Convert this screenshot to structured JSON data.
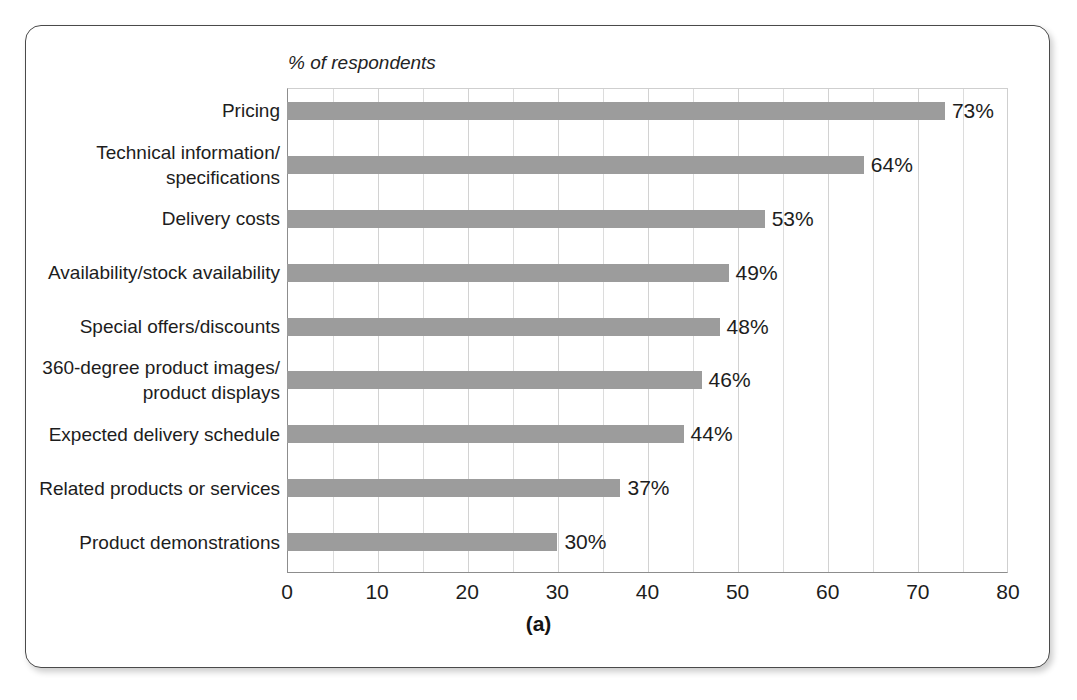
{
  "figure": {
    "caption": "(a)",
    "axis_note": "% of respondents"
  },
  "chart_data": {
    "type": "bar",
    "orientation": "horizontal",
    "title": "",
    "subtitle": "",
    "xlabel": "% of respondents",
    "ylabel": "",
    "xlim": [
      0,
      80
    ],
    "xticks": [
      0,
      10,
      20,
      30,
      40,
      50,
      60,
      70,
      80
    ],
    "xtick_labels": [
      "0",
      "10",
      "20",
      "30",
      "40",
      "50",
      "60",
      "70",
      "80"
    ],
    "minor_gridline_step": 5,
    "grid": "vertical",
    "legend": "none",
    "bar_color": "#9c9c9c",
    "categories": [
      "Pricing",
      "Technical information/\nspecifications",
      "Delivery costs",
      "Availability/stock availability",
      "Special offers/discounts",
      "360-degree product images/\nproduct displays",
      "Expected delivery schedule",
      "Related products or services",
      "Product demonstrations"
    ],
    "values": [
      73,
      64,
      53,
      49,
      48,
      46,
      44,
      37,
      30
    ],
    "data_labels": [
      "73%",
      "64%",
      "53%",
      "49%",
      "48%",
      "46%",
      "44%",
      "37%",
      "30%"
    ]
  },
  "rows": [
    {
      "label_line1": "Pricing",
      "label_line2": "",
      "value": 73,
      "data_label": "73%"
    },
    {
      "label_line1": "Technical information/",
      "label_line2": "specifications",
      "value": 64,
      "data_label": "64%"
    },
    {
      "label_line1": "Delivery costs",
      "label_line2": "",
      "value": 53,
      "data_label": "53%"
    },
    {
      "label_line1": "Availability/stock availability",
      "label_line2": "",
      "value": 49,
      "data_label": "49%"
    },
    {
      "label_line1": "Special offers/discounts",
      "label_line2": "",
      "value": 48,
      "data_label": "48%"
    },
    {
      "label_line1": "360-degree product images/",
      "label_line2": "product displays",
      "value": 46,
      "data_label": "46%"
    },
    {
      "label_line1": "Expected delivery schedule",
      "label_line2": "",
      "value": 44,
      "data_label": "44%"
    },
    {
      "label_line1": "Related products or services",
      "label_line2": "",
      "value": 37,
      "data_label": "37%"
    },
    {
      "label_line1": "Product demonstrations",
      "label_line2": "",
      "value": 30,
      "data_label": "30%"
    }
  ]
}
